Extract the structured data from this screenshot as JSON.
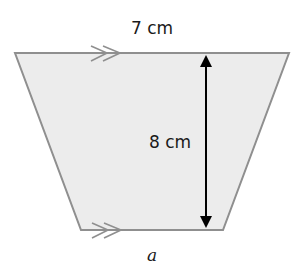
{
  "diagram": {
    "shape": "trapezoid",
    "fill_color": "#ececec",
    "edge_color": "#8f8f8f",
    "arrow_color": "#000000",
    "vertices": {
      "top_left": [
        15,
        53
      ],
      "top_right": [
        289,
        53
      ],
      "bottom_right": [
        223,
        230
      ],
      "bottom_left": [
        81,
        230
      ]
    },
    "labels": {
      "top_side": "7 cm",
      "height": "8 cm",
      "bottom_side": "a"
    },
    "parallel_marks": {
      "top": "double-chevron",
      "bottom": "double-chevron"
    },
    "height_arrow": {
      "x": 206,
      "y_top": 55,
      "y_bottom": 228
    }
  }
}
